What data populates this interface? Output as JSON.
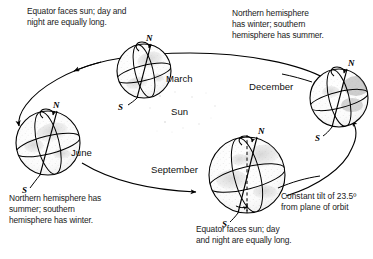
{
  "figure": {
    "width": 373,
    "height": 259,
    "background": "#ffffff",
    "ink": "#000000"
  },
  "center": {
    "sun_label": "Sun"
  },
  "captions": {
    "top_left": "Equator faces sun; day and\nnight are equally long.",
    "top_right": "Northern hemisphere\nhas winter; southern\nhemisphere has summer.",
    "bottom_left": "Northern hemisphere has\nsummer; southern\nhemisphere has winter.",
    "bottom_center": "Equator faces sun; day\nand night are equally long.",
    "tilt": "Constant tilt of 23.5º\nfrom plane of orbit"
  },
  "globes": [
    {
      "id": "march",
      "label": "March",
      "north_pole": "N",
      "south_pole": "S",
      "season_note": "Equator faces sun; day and night are equally long."
    },
    {
      "id": "june",
      "label": "June",
      "north_pole": "N",
      "south_pole": "S",
      "season_note": "Northern hemisphere has summer; southern hemisphere has winter."
    },
    {
      "id": "september",
      "label": "September",
      "north_pole": "N",
      "south_pole": "S",
      "season_note": "Equator faces sun; day and night are equally long."
    },
    {
      "id": "december",
      "label": "December",
      "north_pole": "N",
      "south_pole": "S",
      "season_note": "Northern hemisphere has winter; southern hemisphere has summer."
    }
  ],
  "values": {
    "axial_tilt_degrees": "23.5",
    "tilt_unit": "º"
  }
}
